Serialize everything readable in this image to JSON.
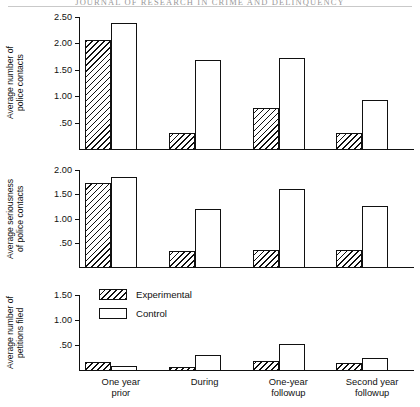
{
  "runhead": "JOURNAL  OF  RESEARCH  IN  CRIME  AND  DELINQUENCY",
  "legend": {
    "items": [
      {
        "key": "experimental",
        "label": "Experimental",
        "fill": "hatched"
      },
      {
        "key": "control",
        "label": "Control",
        "fill": "white"
      }
    ]
  },
  "categories": [
    "One year\nprior",
    "During",
    "One-year\nfollowup",
    "Second year\nfollowup"
  ],
  "chart_data": [
    {
      "type": "bar",
      "title": "",
      "ylabel": "Average number of\npolice contacts",
      "xlabel": "",
      "categories": [
        "One year prior",
        "During",
        "One-year followup",
        "Second year followup"
      ],
      "ylim": [
        0,
        2.5
      ],
      "yticks": [
        0.5,
        1.0,
        1.5,
        2.0,
        2.5
      ],
      "ytick_labels": [
        ".50",
        "1.00",
        "1.50",
        "2.00",
        "2.50"
      ],
      "grid": false,
      "legend_position": "none",
      "series": [
        {
          "name": "Experimental",
          "values": [
            2.08,
            0.32,
            0.8,
            0.33
          ]
        },
        {
          "name": "Control",
          "values": [
            2.4,
            1.7,
            1.75,
            0.95
          ]
        }
      ]
    },
    {
      "type": "bar",
      "title": "",
      "ylabel": "Average seriousness\nof police contacts",
      "xlabel": "",
      "categories": [
        "One year prior",
        "During",
        "One-year followup",
        "Second year followup"
      ],
      "ylim": [
        0,
        2.0
      ],
      "yticks": [
        0.5,
        1.0,
        1.5,
        2.0
      ],
      "ytick_labels": [
        ".50",
        "1.00",
        "1.50",
        "2.00"
      ],
      "grid": false,
      "legend_position": "none",
      "series": [
        {
          "name": "Experimental",
          "values": [
            1.75,
            0.35,
            0.38,
            0.37
          ]
        },
        {
          "name": "Control",
          "values": [
            1.87,
            1.22,
            1.63,
            1.28
          ]
        }
      ]
    },
    {
      "type": "bar",
      "title": "",
      "ylabel": "Average number of\npetitions filed",
      "xlabel": "",
      "categories": [
        "One year prior",
        "During",
        "One-year followup",
        "Second year followup"
      ],
      "ylim": [
        0,
        1.5
      ],
      "yticks": [
        0.5,
        1.0,
        1.5
      ],
      "ytick_labels": [
        ".50",
        "1.00",
        "1.50"
      ],
      "grid": false,
      "legend_position": "inside-upper-left",
      "series": [
        {
          "name": "Experimental",
          "values": [
            0.18,
            0.08,
            0.2,
            0.17
          ]
        },
        {
          "name": "Control",
          "values": [
            0.1,
            0.33,
            0.55,
            0.27
          ]
        }
      ]
    }
  ]
}
